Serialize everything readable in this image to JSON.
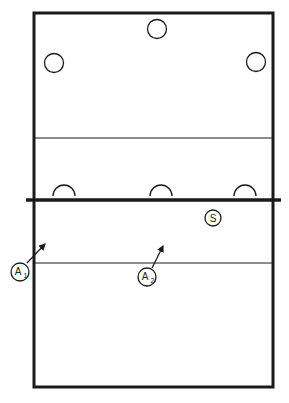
{
  "diagram": {
    "type": "volleyball court",
    "colors": {
      "line": "#1a1a1a",
      "background": "#ffffff"
    },
    "players_top": [
      {
        "id": "p1",
        "x": 157,
        "y": 29
      },
      {
        "id": "p2",
        "x": 54,
        "y": 63
      },
      {
        "id": "p3",
        "x": 256,
        "y": 62
      }
    ],
    "blockers": [
      {
        "id": "b1",
        "x": 64
      },
      {
        "id": "b2",
        "x": 161
      },
      {
        "id": "b3",
        "x": 245
      }
    ],
    "setter": {
      "label": "S",
      "x": 213,
      "y": 218
    },
    "attackers": [
      {
        "label": "A",
        "sub": "1",
        "x": 20,
        "y": 272
      },
      {
        "label": "A",
        "sub": "2",
        "x": 147,
        "y": 277
      }
    ]
  }
}
